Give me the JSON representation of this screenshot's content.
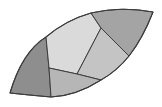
{
  "diagram": {
    "width": 162,
    "height": 107,
    "background": "#ffffff",
    "stroke": "#3c3c3c",
    "regions": [
      {
        "id": "left-dark",
        "fill": "#8e8e8e",
        "d": "M10,93 Q22,52 46,37 L49,68 L51,97 Q28,95 10,93 Z"
      },
      {
        "id": "center-light",
        "fill": "#dadada",
        "d": "M46,37 Q66,20 91,13 L101,28 L77,74 L49,68 Z"
      },
      {
        "id": "top-right-dark",
        "fill": "#a4a4a4",
        "d": "M91,13 Q122,6 153,12 Q143,38 129,56 L101,28 Z"
      },
      {
        "id": "right-mid",
        "fill": "#c4c4c4",
        "d": "M101,28 L129,56 Q117,71 101,80 L77,74 Z"
      },
      {
        "id": "bottom-mid",
        "fill": "#b6b6b6",
        "d": "M49,68 L77,74 L101,80 Q76,96 51,97 Z"
      }
    ],
    "outline": "M10,93 Q22,52 46,37 Q66,20 91,13 Q122,6 153,12 Q143,38 129,56 Q117,71 101,80 Q76,96 51,97 Q28,95 10,93 Z"
  }
}
